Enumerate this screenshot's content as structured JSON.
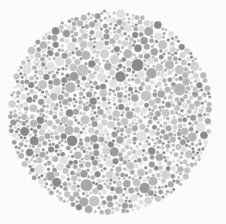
{
  "figure": {
    "kind": "ishihara-plate",
    "width": 226,
    "height": 224,
    "background_color": "#fbfbfb"
  },
  "plate": {
    "center_x": 110,
    "center_y": 112,
    "radius": 102,
    "hidden_numeral": "",
    "numeral_visible": false,
    "rendering": "grayscale-desaturated",
    "dot_count": 1150,
    "dot_min_diameter": 3,
    "dot_max_diameter": 13,
    "edge_softness": 1.5,
    "random_seed": 20240517
  },
  "chart_data": {
    "type": "scatter",
    "xlabel": "",
    "ylabel": "",
    "xlim": [
      0,
      226
    ],
    "ylim": [
      0,
      224
    ],
    "grid": false,
    "legend": "none",
    "marker": "circle",
    "note": "Dots fill a disc centered at (110,112) with radius 102. All dots are achromatic greys; no numeral is discernible.",
    "palette": {
      "background": "#fbfbfb",
      "dark_grey": "#8a8a8a",
      "mid_dark_grey": "#a0a0a0",
      "mid_grey": "#b4b4b4",
      "mid_light_grey": "#c8c8c8",
      "light_grey": "#d8d8d8",
      "pale_grey": "#e4e4e4"
    },
    "tone_weights": [
      {
        "color": "#8a8a8a",
        "weight": 0.13
      },
      {
        "color": "#9a9a9a",
        "weight": 0.14
      },
      {
        "color": "#a8a8a8",
        "weight": 0.15
      },
      {
        "color": "#b6b6b6",
        "weight": 0.16
      },
      {
        "color": "#c4c4c4",
        "weight": 0.16
      },
      {
        "color": "#d2d2d2",
        "weight": 0.14
      },
      {
        "color": "#e0e0e0",
        "weight": 0.12
      }
    ],
    "size_weights": [
      {
        "diameter": 3.5,
        "weight": 0.2
      },
      {
        "diameter": 5.0,
        "weight": 0.24
      },
      {
        "diameter": 6.5,
        "weight": 0.22
      },
      {
        "diameter": 8.0,
        "weight": 0.16
      },
      {
        "diameter": 9.5,
        "weight": 0.1
      },
      {
        "diameter": 11.0,
        "weight": 0.05
      },
      {
        "diameter": 12.5,
        "weight": 0.03
      }
    ]
  }
}
